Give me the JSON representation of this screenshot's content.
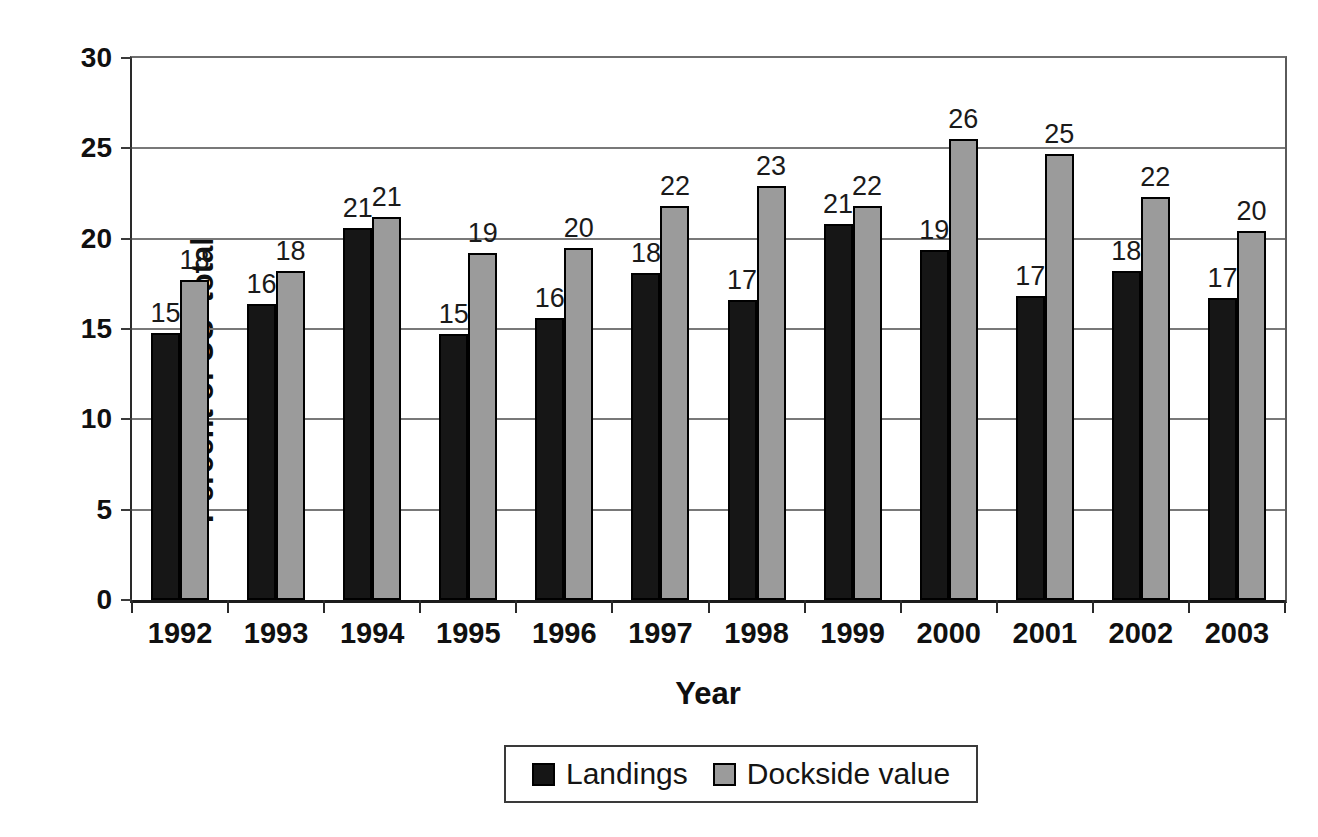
{
  "figure": {
    "y_axis_title": "Percent of US  total",
    "x_axis_title": "Year"
  },
  "chart_data": {
    "type": "bar",
    "title": "",
    "xlabel": "Year",
    "ylabel": "Percent of US  total",
    "ylim": [
      0,
      30
    ],
    "yticks": [
      0,
      5,
      10,
      15,
      20,
      25,
      30
    ],
    "grid": true,
    "legend_position": "bottom",
    "categories": [
      "1992",
      "1993",
      "1994",
      "1995",
      "1996",
      "1997",
      "1998",
      "1999",
      "2000",
      "2001",
      "2002",
      "2003"
    ],
    "series": [
      {
        "name": "Landings",
        "color": "#161616",
        "values": [
          14.8,
          16.4,
          20.6,
          14.7,
          15.6,
          18.1,
          16.6,
          20.8,
          19.4,
          16.8,
          18.2,
          16.7
        ],
        "labels": [
          "15",
          "16",
          "21",
          "15",
          "16",
          "18",
          "17",
          "21",
          "19",
          "17",
          "18",
          "17"
        ]
      },
      {
        "name": "Dockside value",
        "color": "#9b9b9b",
        "values": [
          17.7,
          18.2,
          21.2,
          19.2,
          19.5,
          21.8,
          22.9,
          21.8,
          25.5,
          24.7,
          22.3,
          20.4
        ],
        "labels": [
          "18",
          "18",
          "21",
          "19",
          "20",
          "22",
          "23",
          "22",
          "26",
          "25",
          "22",
          "20"
        ]
      }
    ]
  }
}
